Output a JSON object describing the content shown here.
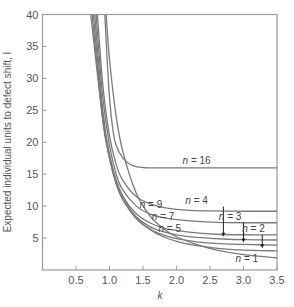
{
  "chart_data": {
    "type": "line",
    "title": "",
    "xlabel": "k",
    "ylabel": "Expected individual units to defect shift, I",
    "xlim": [
      0,
      3.5
    ],
    "ylim": [
      0,
      40
    ],
    "xticks": [
      0.5,
      1.0,
      1.5,
      2.0,
      2.5,
      3.0,
      3.5
    ],
    "xtick_labels": [
      "0.5",
      "1.0",
      "1.5",
      "2.0",
      "2.5",
      "3.0",
      "3.5"
    ],
    "yticks": [
      5,
      10,
      15,
      20,
      25,
      30,
      35,
      40
    ],
    "ytick_labels": [
      "5",
      "10",
      "15",
      "20",
      "25",
      "30",
      "35",
      "40"
    ],
    "grid": false,
    "legend": "none (inline annotations)",
    "series": [
      {
        "name": "n = 16",
        "asymptote": 16.0,
        "x": [
          0.93,
          0.97,
          1.0,
          1.05,
          1.1,
          1.2,
          1.3,
          1.4,
          1.5,
          1.6,
          2.0,
          2.5,
          3.0,
          3.5
        ],
        "y": [
          40,
          32,
          27,
          22,
          19.5,
          17.5,
          16.6,
          16.2,
          16.05,
          16.0,
          16.0,
          16.0,
          16.0,
          16.0
        ]
      },
      {
        "name": "n = 9",
        "asymptote": 9.2,
        "x": [
          0.82,
          0.9,
          1.0,
          1.1,
          1.2,
          1.4,
          1.6,
          1.8,
          2.0,
          2.2,
          2.5,
          3.0,
          3.5
        ],
        "y": [
          40,
          29,
          21,
          16.5,
          14,
          11.5,
          10.4,
          9.8,
          9.5,
          9.35,
          9.25,
          9.2,
          9.2
        ]
      },
      {
        "name": "n = 7",
        "asymptote": 7.4,
        "x": [
          0.8,
          0.9,
          1.0,
          1.1,
          1.2,
          1.4,
          1.6,
          1.8,
          2.0,
          2.3,
          2.6,
          3.0,
          3.5
        ],
        "y": [
          40,
          27,
          19.5,
          15,
          12.5,
          10,
          8.8,
          8.2,
          7.9,
          7.6,
          7.45,
          7.4,
          7.4
        ]
      },
      {
        "name": "n = 5",
        "asymptote": 5.5,
        "x": [
          0.78,
          0.9,
          1.0,
          1.1,
          1.2,
          1.4,
          1.6,
          1.8,
          2.0,
          2.3,
          2.6,
          3.0,
          3.5
        ],
        "y": [
          40,
          25,
          18,
          14,
          11.5,
          8.8,
          7.4,
          6.6,
          6.2,
          5.8,
          5.6,
          5.52,
          5.5
        ]
      },
      {
        "name": "n = 4",
        "asymptote": 4.7,
        "x": [
          0.76,
          0.9,
          1.0,
          1.1,
          1.2,
          1.4,
          1.6,
          1.8,
          2.0,
          2.3,
          2.7,
          3.0,
          3.5
        ],
        "y": [
          40,
          24,
          17.5,
          13.5,
          11,
          8.3,
          6.8,
          6.0,
          5.5,
          5.1,
          4.85,
          4.75,
          4.7
        ]
      },
      {
        "name": "n = 3",
        "asymptote": 3.9,
        "x": [
          0.74,
          0.9,
          1.0,
          1.1,
          1.2,
          1.4,
          1.6,
          1.8,
          2.0,
          2.3,
          2.7,
          3.0,
          3.5
        ],
        "y": [
          40,
          23.5,
          17.5,
          13.5,
          11,
          8,
          6.4,
          5.5,
          4.9,
          4.4,
          4.1,
          4.0,
          3.9
        ]
      },
      {
        "name": "n = 2",
        "asymptote": 3.0,
        "x": [
          0.72,
          0.9,
          1.0,
          1.1,
          1.2,
          1.4,
          1.6,
          1.8,
          2.0,
          2.3,
          2.7,
          3.0,
          3.5
        ],
        "y": [
          40,
          23.5,
          18,
          14,
          11.5,
          8.2,
          6.4,
          5.2,
          4.5,
          3.8,
          3.3,
          3.1,
          3.0
        ]
      },
      {
        "name": "n = 1",
        "asymptote": 1.9,
        "x": [
          0.95,
          1.0,
          1.1,
          1.2,
          1.4,
          1.6,
          1.8,
          2.0,
          2.3,
          2.6,
          3.0,
          3.5
        ],
        "y": [
          40,
          33,
          24,
          18.5,
          12,
          8.5,
          6.5,
          5.2,
          4.0,
          3.1,
          2.4,
          1.9
        ]
      }
    ],
    "annotations": [
      {
        "text": "n = 16",
        "x": 2.3,
        "y": 16.6
      },
      {
        "text": "n = 9",
        "x": 1.62,
        "y": 9.7
      },
      {
        "text": "n = 4",
        "x": 2.3,
        "y": 10.4,
        "arrow_to": [
          2.7,
          5.2
        ]
      },
      {
        "text": "n = 7",
        "x": 1.8,
        "y": 7.9
      },
      {
        "text": "n = 3",
        "x": 2.8,
        "y": 7.9,
        "arrow_to": [
          3.0,
          4.3
        ]
      },
      {
        "text": "n = 5",
        "x": 1.9,
        "y": 6.0
      },
      {
        "text": "n = 2",
        "x": 3.15,
        "y": 6.0,
        "arrow_to": [
          3.28,
          3.4
        ]
      },
      {
        "text": "n = 1",
        "x": 3.05,
        "y": 1.3
      }
    ]
  },
  "colors": {
    "curve": "#7a7a7a",
    "axis": "#9a9a9a",
    "text": "#555555"
  }
}
